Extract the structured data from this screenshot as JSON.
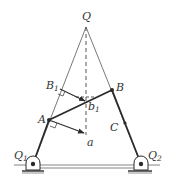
{
  "diagram": {
    "type": "four-bar linkage velocity diagram",
    "labels": {
      "Q": "Q",
      "B1": "B",
      "B1_sub": "1",
      "b1": "b",
      "b1_sub": "1",
      "B": "B",
      "A": "A",
      "C": "C",
      "a": "a",
      "Q1": "Q",
      "Q1_sub": "1",
      "Q2": "Q",
      "Q2_sub": "2"
    },
    "colors": {
      "line": "#2a2a2a",
      "thin": "#555555",
      "background": "#ffffff"
    }
  }
}
